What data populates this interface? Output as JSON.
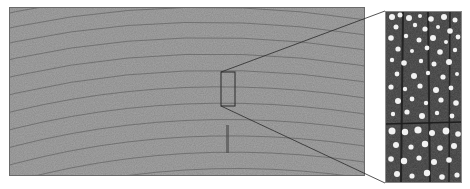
{
  "figure": {
    "main_panel": {
      "x": 9,
      "y": 7,
      "width": 356,
      "height": 169,
      "fill": "#8a8a8a",
      "ring_color": "#5e5e5e"
    },
    "inset_box": {
      "x": 221,
      "y": 72,
      "width": 14,
      "height": 34,
      "stroke": "#2a2a2a"
    },
    "zoom_panel": {
      "x": 385,
      "y": 11,
      "width": 77,
      "height": 172,
      "fill": "#3a3a3a",
      "pore_color": "#f2f2f2"
    },
    "connector_lines": [
      {
        "x1": 221,
        "y1": 72,
        "x2": 385,
        "y2": 11
      },
      {
        "x1": 221,
        "y1": 106,
        "x2": 385,
        "y2": 183
      }
    ]
  }
}
